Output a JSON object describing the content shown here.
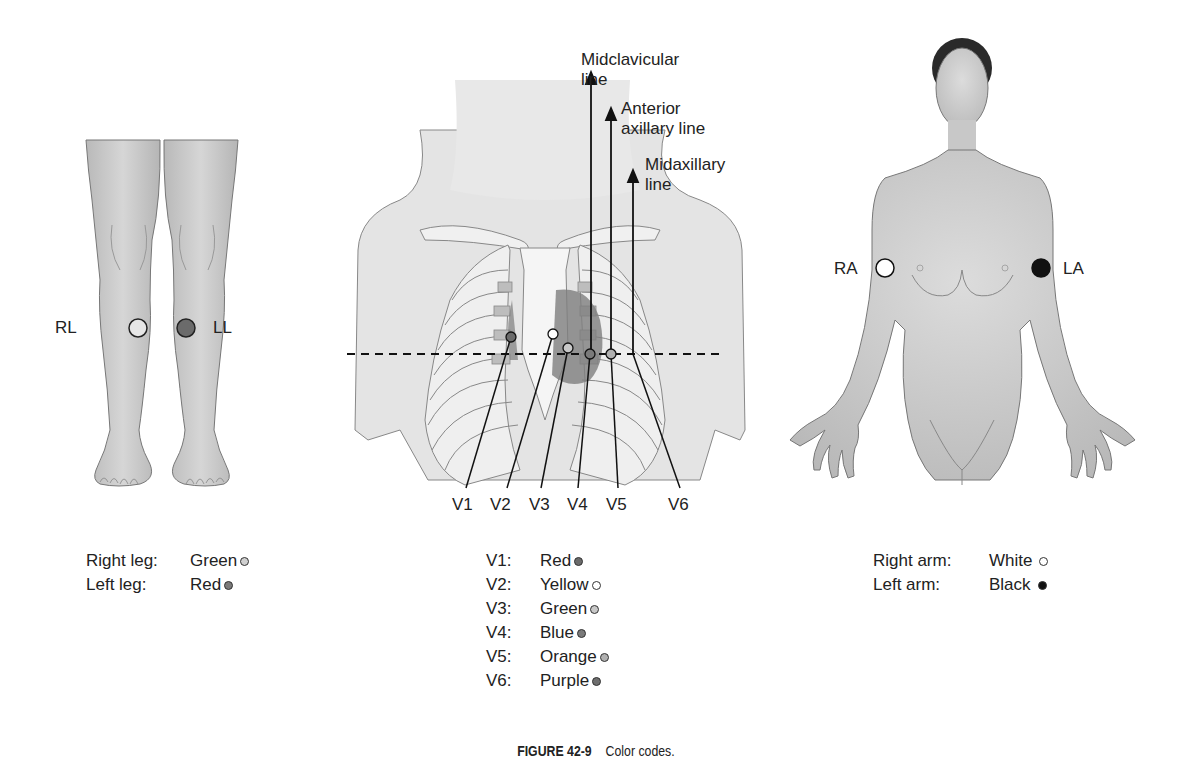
{
  "figure": {
    "number": "FIGURE 42-9",
    "caption": "Color codes."
  },
  "legs_panel": {
    "electrodes": [
      {
        "label": "RL",
        "name": "Right leg",
        "color_name": "Green",
        "fill": "#e6e6e6"
      },
      {
        "label": "LL",
        "name": "Left leg",
        "color_name": "Red",
        "fill": "#6b6b6b"
      }
    ],
    "legend": [
      {
        "key": "Right leg:",
        "value": "Green",
        "dot": "#d0d0d0"
      },
      {
        "key": "Left leg:",
        "value": "Red",
        "dot": "#7a7a7a"
      }
    ]
  },
  "chest_panel": {
    "reference_lines": [
      {
        "id": "midclavicular",
        "line1": "Midclavicular",
        "line2": "line"
      },
      {
        "id": "anterior_axillary",
        "line1": "Anterior",
        "line2": "axillary line"
      },
      {
        "id": "midaxillary",
        "line1": "Midaxillary",
        "line2": "line"
      }
    ],
    "leads": [
      {
        "label": "V1",
        "color_name": "Red",
        "dot": "#6b6b6b"
      },
      {
        "label": "V2",
        "color_name": "Yellow",
        "dot": "#ffffff"
      },
      {
        "label": "V3",
        "color_name": "Green",
        "dot": "#c8c8c8"
      },
      {
        "label": "V4",
        "color_name": "Blue",
        "dot": "#7a7a7a"
      },
      {
        "label": "V5",
        "color_name": "Orange",
        "dot": "#b0b0b0"
      },
      {
        "label": "V6",
        "color_name": "Purple",
        "dot": "#6e6e6e"
      }
    ],
    "legend": [
      {
        "key": "V1:",
        "value": "Red",
        "dot": "#6b6b6b"
      },
      {
        "key": "V2:",
        "value": "Yellow",
        "dot": "#ffffff"
      },
      {
        "key": "V3:",
        "value": "Green",
        "dot": "#c8c8c8"
      },
      {
        "key": "V4:",
        "value": "Blue",
        "dot": "#7a7a7a"
      },
      {
        "key": "V5:",
        "value": "Orange",
        "dot": "#b0b0b0"
      },
      {
        "key": "V6:",
        "value": "Purple",
        "dot": "#6e6e6e"
      }
    ]
  },
  "arms_panel": {
    "electrodes": [
      {
        "label": "RA",
        "name": "Right arm",
        "color_name": "White",
        "fill": "#ffffff"
      },
      {
        "label": "LA",
        "name": "Left arm",
        "color_name": "Black",
        "fill": "#111111"
      }
    ],
    "legend": [
      {
        "key": "Right arm:",
        "value": "White",
        "dot": "#ffffff"
      },
      {
        "key": "Left arm:",
        "value": "Black",
        "dot": "#111111"
      }
    ]
  }
}
